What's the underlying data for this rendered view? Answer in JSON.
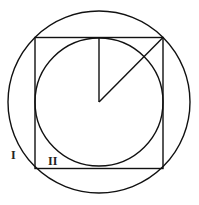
{
  "diagram": {
    "labels": {
      "region_outer": "I",
      "region_inner": "II"
    },
    "colors": {
      "stroke": "#111111",
      "background": "#ffffff"
    }
  }
}
